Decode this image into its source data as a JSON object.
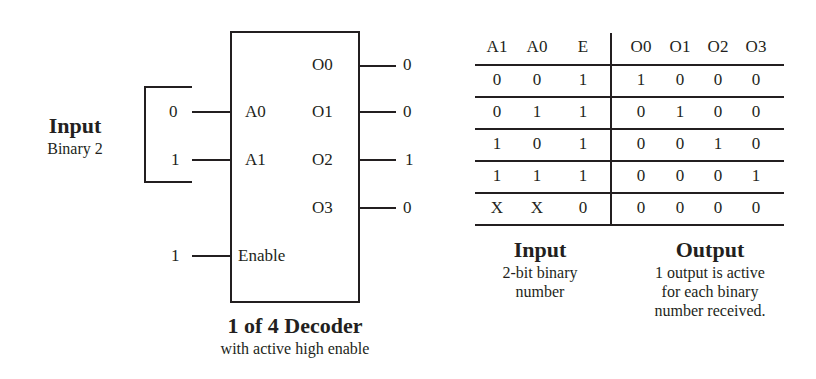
{
  "diagram": {
    "title": "1 of 4 Decoder",
    "subtitle": "with active high enable",
    "input_label": {
      "title": "Input",
      "subtitle": "Binary 2"
    },
    "inputs": [
      {
        "pin": "A0",
        "value": "0"
      },
      {
        "pin": "A1",
        "value": "1"
      }
    ],
    "enable": {
      "pin": "Enable",
      "value": "1"
    },
    "outputs": [
      {
        "pin": "O0",
        "value": "0"
      },
      {
        "pin": "O1",
        "value": "0"
      },
      {
        "pin": "O2",
        "value": "1"
      },
      {
        "pin": "O3",
        "value": "0"
      }
    ]
  },
  "truth_table": {
    "headers": [
      "A1",
      "A0",
      "E",
      "O0",
      "O1",
      "O2",
      "O3"
    ],
    "rows": [
      [
        "0",
        "0",
        "1",
        "1",
        "0",
        "0",
        "0"
      ],
      [
        "0",
        "1",
        "1",
        "0",
        "1",
        "0",
        "0"
      ],
      [
        "1",
        "0",
        "1",
        "0",
        "0",
        "1",
        "0"
      ],
      [
        "1",
        "1",
        "1",
        "0",
        "0",
        "0",
        "1"
      ],
      [
        "X",
        "X",
        "0",
        "0",
        "0",
        "0",
        "0"
      ]
    ],
    "input_caption": {
      "title": "Input",
      "lines": [
        "2-bit binary",
        "number"
      ]
    },
    "output_caption": {
      "title": "Output",
      "lines": [
        "1 output is active",
        "for each binary",
        "number received."
      ]
    }
  }
}
